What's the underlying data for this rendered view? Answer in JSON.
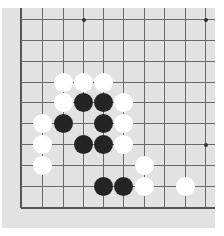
{
  "board": {
    "description": "Partial Go board, lower-left corner region",
    "colors": {
      "board": "#e2e2e2",
      "line": "#6a6a6a",
      "black": "#242424",
      "white": "#ffffff"
    },
    "grid": {
      "x": [
        21,
        42,
        63,
        83,
        103,
        123,
        144,
        164,
        185,
        205
      ],
      "y": [
        19,
        40,
        61,
        82,
        102,
        123,
        144,
        165,
        186,
        207
      ],
      "left_edge_col": 0,
      "bottom_edge_row": 9
    },
    "star_points": [
      {
        "col": 3,
        "row": 0
      },
      {
        "col": 9,
        "row": 0
      },
      {
        "col": 3,
        "row": 6
      },
      {
        "col": 9,
        "row": 6
      }
    ],
    "stones": [
      {
        "color": "white",
        "col": 2,
        "row": 3
      },
      {
        "color": "white",
        "col": 3,
        "row": 3
      },
      {
        "color": "white",
        "col": 4,
        "row": 3
      },
      {
        "color": "white",
        "col": 2,
        "row": 4
      },
      {
        "color": "black",
        "col": 3,
        "row": 4
      },
      {
        "color": "black",
        "col": 4,
        "row": 4
      },
      {
        "color": "white",
        "col": 5,
        "row": 4
      },
      {
        "color": "white",
        "col": 1,
        "row": 5
      },
      {
        "color": "black",
        "col": 2,
        "row": 5
      },
      {
        "color": "black",
        "col": 4,
        "row": 5
      },
      {
        "color": "white",
        "col": 5,
        "row": 5
      },
      {
        "color": "white",
        "col": 1,
        "row": 6
      },
      {
        "color": "black",
        "col": 3,
        "row": 6
      },
      {
        "color": "black",
        "col": 4,
        "row": 6
      },
      {
        "color": "white",
        "col": 5,
        "row": 6
      },
      {
        "color": "white",
        "col": 1,
        "row": 7
      },
      {
        "color": "white",
        "col": 6,
        "row": 7
      },
      {
        "color": "black",
        "col": 4,
        "row": 8
      },
      {
        "color": "black",
        "col": 5,
        "row": 8
      },
      {
        "color": "white",
        "col": 6,
        "row": 8
      },
      {
        "color": "white",
        "col": 8,
        "row": 8
      }
    ]
  }
}
